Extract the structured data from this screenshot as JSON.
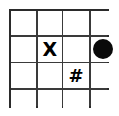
{
  "grid": {
    "rows": 4,
    "columns": 4,
    "line_color": "#3a3a3a",
    "border_color": "#2b2b2b",
    "cell_background": "#ffffff",
    "mark_color": "#000000",
    "cells": [
      [
        {
          "id": "r1c1",
          "mark": "empty",
          "label": ""
        },
        {
          "id": "r1c2",
          "mark": "empty",
          "label": ""
        },
        {
          "id": "r1c3",
          "mark": "empty",
          "label": ""
        },
        {
          "id": "r1c4",
          "mark": "empty",
          "label": ""
        }
      ],
      [
        {
          "id": "r2c1",
          "mark": "empty",
          "label": ""
        },
        {
          "id": "r2c2",
          "mark": "letter-x",
          "label": "X"
        },
        {
          "id": "r2c3",
          "mark": "empty",
          "label": ""
        },
        {
          "id": "r2c4",
          "mark": "filled-circle",
          "label": ""
        }
      ],
      [
        {
          "id": "r3c1",
          "mark": "empty",
          "label": ""
        },
        {
          "id": "r3c2",
          "mark": "empty",
          "label": ""
        },
        {
          "id": "r3c3",
          "mark": "hash",
          "label": "#"
        },
        {
          "id": "r3c4",
          "mark": "empty",
          "label": ""
        }
      ],
      [
        {
          "id": "r4c1",
          "mark": "empty",
          "label": ""
        },
        {
          "id": "r4c2",
          "mark": "empty",
          "label": ""
        },
        {
          "id": "r4c3",
          "mark": "empty",
          "label": ""
        },
        {
          "id": "r4c4",
          "mark": "empty",
          "label": ""
        }
      ]
    ]
  }
}
